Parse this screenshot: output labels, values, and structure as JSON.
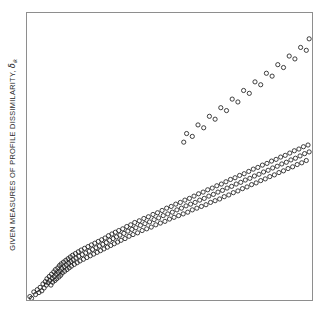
{
  "figure": {
    "background_color": "#ffffff",
    "frame_color": "#8e8e8e",
    "marker_color": "#1f1f1f"
  },
  "axis": {
    "y_label_prefix": "GIVEN MEASURES OF PROFILE DISSIMILARITY, ",
    "y_label_symbol": "δ",
    "y_label_subscript": "ik",
    "y_label_full": "GIVEN MEASURES OF PROFILE DISSIMILARITY, δik",
    "x_label": "",
    "x_tick_labels": [],
    "y_tick_labels": []
  },
  "chart_data": {
    "type": "scatter",
    "title": "",
    "subtitle": "",
    "xlabel": "",
    "ylabel": "GIVEN MEASURES OF PROFILE DISSIMILARITY, δik",
    "xlim": [
      0,
      100
    ],
    "ylim": [
      0,
      100
    ],
    "grid": false,
    "legend": null,
    "annotations": [],
    "marker": {
      "shape": "open-circle",
      "radius_px": 2.1,
      "stroke_width_px": 0.85,
      "fill": "none"
    },
    "n_points": 300,
    "series": [
      {
        "name": "profile dissimilarity vs distance",
        "points": [
          [
            1.0,
            1.2
          ],
          [
            1.6,
            0.6
          ],
          [
            2.4,
            2.8
          ],
          [
            3.0,
            1.9
          ],
          [
            3.6,
            3.6
          ],
          [
            4.2,
            2.6
          ],
          [
            4.6,
            4.4
          ],
          [
            5.2,
            3.2
          ],
          [
            5.6,
            5.6
          ],
          [
            6.0,
            4.2
          ],
          [
            6.4,
            6.4
          ],
          [
            6.8,
            5.2
          ],
          [
            7.0,
            7.4
          ],
          [
            7.4,
            6.0
          ],
          [
            7.8,
            8.2
          ],
          [
            8.0,
            6.8
          ],
          [
            8.4,
            5.2
          ],
          [
            8.6,
            9.0
          ],
          [
            8.8,
            7.6
          ],
          [
            9.0,
            6.2
          ],
          [
            9.4,
            9.8
          ],
          [
            9.6,
            8.2
          ],
          [
            9.8,
            6.8
          ],
          [
            10.0,
            10.6
          ],
          [
            10.2,
            9.0
          ],
          [
            10.4,
            7.4
          ],
          [
            10.8,
            11.2
          ],
          [
            11.0,
            9.6
          ],
          [
            11.2,
            8.0
          ],
          [
            11.4,
            12.0
          ],
          [
            11.6,
            10.2
          ],
          [
            11.8,
            8.6
          ],
          [
            12.0,
            12.6
          ],
          [
            12.2,
            11.0
          ],
          [
            12.4,
            9.4
          ],
          [
            12.8,
            13.2
          ],
          [
            13.0,
            11.6
          ],
          [
            13.2,
            10.0
          ],
          [
            13.6,
            13.8
          ],
          [
            13.8,
            12.2
          ],
          [
            14.0,
            10.6
          ],
          [
            14.4,
            14.4
          ],
          [
            14.6,
            12.8
          ],
          [
            14.8,
            11.2
          ],
          [
            15.2,
            15.0
          ],
          [
            15.4,
            13.4
          ],
          [
            15.6,
            11.8
          ],
          [
            16.0,
            15.6
          ],
          [
            16.2,
            14.0
          ],
          [
            16.6,
            12.4
          ],
          [
            17.0,
            16.2
          ],
          [
            17.2,
            14.6
          ],
          [
            17.6,
            13.0
          ],
          [
            18.0,
            16.8
          ],
          [
            18.2,
            15.2
          ],
          [
            18.6,
            13.6
          ],
          [
            19.0,
            17.4
          ],
          [
            19.4,
            15.8
          ],
          [
            19.8,
            14.2
          ],
          [
            20.2,
            18.0
          ],
          [
            20.6,
            16.4
          ],
          [
            21.0,
            14.8
          ],
          [
            21.4,
            18.6
          ],
          [
            21.8,
            17.0
          ],
          [
            22.2,
            15.4
          ],
          [
            22.6,
            19.2
          ],
          [
            23.0,
            17.6
          ],
          [
            23.4,
            16.0
          ],
          [
            23.8,
            19.8
          ],
          [
            24.2,
            18.2
          ],
          [
            24.6,
            16.6
          ],
          [
            25.0,
            20.4
          ],
          [
            25.4,
            18.8
          ],
          [
            25.8,
            17.2
          ],
          [
            26.2,
            21.0
          ],
          [
            26.6,
            19.4
          ],
          [
            27.0,
            17.8
          ],
          [
            27.4,
            21.6
          ],
          [
            27.8,
            20.0
          ],
          [
            28.2,
            18.4
          ],
          [
            28.6,
            22.4
          ],
          [
            29.0,
            20.8
          ],
          [
            29.4,
            19.0
          ],
          [
            29.8,
            23.0
          ],
          [
            30.2,
            21.4
          ],
          [
            30.6,
            19.6
          ],
          [
            31.0,
            23.6
          ],
          [
            31.4,
            22.0
          ],
          [
            31.8,
            20.2
          ],
          [
            32.2,
            24.2
          ],
          [
            32.6,
            22.6
          ],
          [
            33.0,
            20.8
          ],
          [
            33.6,
            24.8
          ],
          [
            34.0,
            23.2
          ],
          [
            34.4,
            21.4
          ],
          [
            35.0,
            25.6
          ],
          [
            35.4,
            24.0
          ],
          [
            35.8,
            22.2
          ],
          [
            36.4,
            26.2
          ],
          [
            36.8,
            24.6
          ],
          [
            37.2,
            22.8
          ],
          [
            37.8,
            27.0
          ],
          [
            38.2,
            25.2
          ],
          [
            38.8,
            23.4
          ],
          [
            39.4,
            27.6
          ],
          [
            39.8,
            26.0
          ],
          [
            40.4,
            24.2
          ],
          [
            41.0,
            28.4
          ],
          [
            41.4,
            26.6
          ],
          [
            42.0,
            24.8
          ],
          [
            42.6,
            29.0
          ],
          [
            43.0,
            27.2
          ],
          [
            43.6,
            25.4
          ],
          [
            44.2,
            29.8
          ],
          [
            44.6,
            28.0
          ],
          [
            45.2,
            26.2
          ],
          [
            45.8,
            30.4
          ],
          [
            46.2,
            28.6
          ],
          [
            46.8,
            26.8
          ],
          [
            47.4,
            31.2
          ],
          [
            47.8,
            29.4
          ],
          [
            48.4,
            27.4
          ],
          [
            49.0,
            32.0
          ],
          [
            49.4,
            30.0
          ],
          [
            50.0,
            28.2
          ],
          [
            50.6,
            32.6
          ],
          [
            51.0,
            30.6
          ],
          [
            51.6,
            28.8
          ],
          [
            52.2,
            33.4
          ],
          [
            52.6,
            31.4
          ],
          [
            53.2,
            29.4
          ],
          [
            53.8,
            34.0
          ],
          [
            54.2,
            32.0
          ],
          [
            54.8,
            30.0
          ],
          [
            55.4,
            34.8
          ],
          [
            55.8,
            32.8
          ],
          [
            56.4,
            30.6
          ],
          [
            57.0,
            35.4
          ],
          [
            57.4,
            33.4
          ],
          [
            58.0,
            31.4
          ],
          [
            58.6,
            36.2
          ],
          [
            59.0,
            34.0
          ],
          [
            59.6,
            32.0
          ],
          [
            60.2,
            37.0
          ],
          [
            60.6,
            34.8
          ],
          [
            61.2,
            32.6
          ],
          [
            61.8,
            37.6
          ],
          [
            62.2,
            35.4
          ],
          [
            62.8,
            33.2
          ],
          [
            63.4,
            38.4
          ],
          [
            63.8,
            36.2
          ],
          [
            64.4,
            34.0
          ],
          [
            65.0,
            39.0
          ],
          [
            65.4,
            36.8
          ],
          [
            66.0,
            34.6
          ],
          [
            66.6,
            39.8
          ],
          [
            67.0,
            37.6
          ],
          [
            67.6,
            35.2
          ],
          [
            68.2,
            40.4
          ],
          [
            68.6,
            38.2
          ],
          [
            69.2,
            36.0
          ],
          [
            69.8,
            41.2
          ],
          [
            70.2,
            39.0
          ],
          [
            70.8,
            36.6
          ],
          [
            71.4,
            42.0
          ],
          [
            71.8,
            39.6
          ],
          [
            72.4,
            37.4
          ],
          [
            73.0,
            42.6
          ],
          [
            73.4,
            40.4
          ],
          [
            74.0,
            38.0
          ],
          [
            74.6,
            43.4
          ],
          [
            75.0,
            41.0
          ],
          [
            75.6,
            38.8
          ],
          [
            76.2,
            44.0
          ],
          [
            76.6,
            41.8
          ],
          [
            77.2,
            39.4
          ],
          [
            77.8,
            44.8
          ],
          [
            78.2,
            42.4
          ],
          [
            78.8,
            40.2
          ],
          [
            79.4,
            45.6
          ],
          [
            79.8,
            43.2
          ],
          [
            80.4,
            40.8
          ],
          [
            81.0,
            46.2
          ],
          [
            81.4,
            43.8
          ],
          [
            82.0,
            41.6
          ],
          [
            82.6,
            47.0
          ],
          [
            83.0,
            44.6
          ],
          [
            83.6,
            42.2
          ],
          [
            84.2,
            47.6
          ],
          [
            84.6,
            45.2
          ],
          [
            85.2,
            43.0
          ],
          [
            85.8,
            48.4
          ],
          [
            86.2,
            46.0
          ],
          [
            86.8,
            43.6
          ],
          [
            87.4,
            49.0
          ],
          [
            87.8,
            46.6
          ],
          [
            88.4,
            44.4
          ],
          [
            89.0,
            49.8
          ],
          [
            89.4,
            47.4
          ],
          [
            90.0,
            45.0
          ],
          [
            90.6,
            50.4
          ],
          [
            91.0,
            48.0
          ],
          [
            91.6,
            45.8
          ],
          [
            92.2,
            51.2
          ],
          [
            92.6,
            48.8
          ],
          [
            93.2,
            46.4
          ],
          [
            93.8,
            52.0
          ],
          [
            94.2,
            49.4
          ],
          [
            94.8,
            47.2
          ],
          [
            95.4,
            52.6
          ],
          [
            95.8,
            50.2
          ],
          [
            96.4,
            47.8
          ],
          [
            97.0,
            53.4
          ],
          [
            97.4,
            51.0
          ],
          [
            98.0,
            48.6
          ],
          [
            98.6,
            54.0
          ],
          [
            99.0,
            51.6
          ],
          [
            55.0,
            55.0
          ],
          [
            56.0,
            58.0
          ],
          [
            58.0,
            57.0
          ],
          [
            60.0,
            61.0
          ],
          [
            62.0,
            60.0
          ],
          [
            64.0,
            64.0
          ],
          [
            66.0,
            63.0
          ],
          [
            68.0,
            67.0
          ],
          [
            70.0,
            66.0
          ],
          [
            72.0,
            70.0
          ],
          [
            74.0,
            69.0
          ],
          [
            76.0,
            73.0
          ],
          [
            78.0,
            72.0
          ],
          [
            80.0,
            76.0
          ],
          [
            82.0,
            75.0
          ],
          [
            84.0,
            79.0
          ],
          [
            86.0,
            78.0
          ],
          [
            88.0,
            82.0
          ],
          [
            90.0,
            81.0
          ],
          [
            92.0,
            85.0
          ],
          [
            94.0,
            84.0
          ],
          [
            96.0,
            88.0
          ],
          [
            98.0,
            87.0
          ],
          [
            99.0,
            91.0
          ]
        ]
      }
    ]
  }
}
